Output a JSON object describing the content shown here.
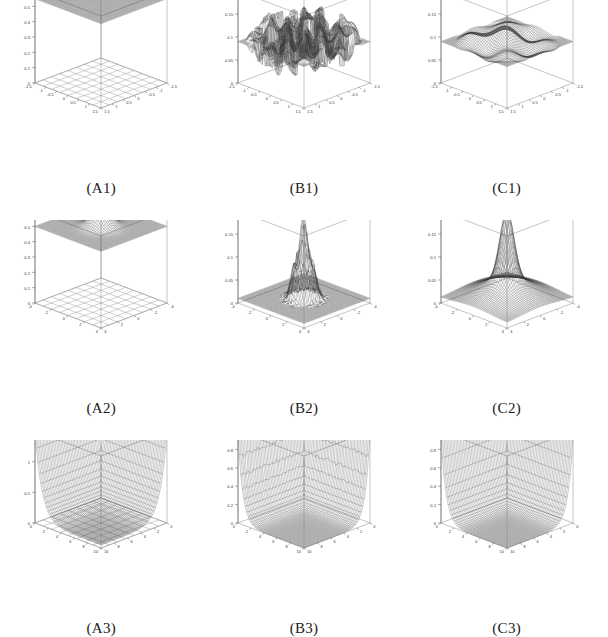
{
  "figure": {
    "layout": {
      "rows": 3,
      "cols": 3
    },
    "panels": [
      {
        "caption": "(A1)",
        "surface_kind": "plane",
        "shade": "dark",
        "floor_grid": true,
        "chart_data": {
          "type": "surface",
          "title": "(A1)",
          "xlabel": "",
          "ylabel": "",
          "zlabel": "",
          "xlim": [
            -1.5,
            1.5
          ],
          "ylim": [
            -1.5,
            1.5
          ],
          "zlim": [
            0,
            0.6
          ],
          "xticks": [
            "-1.5",
            "-1",
            "-0.5",
            "0",
            "0.5",
            "1",
            "1.5"
          ],
          "yticks": [
            "-1.5",
            "-1",
            "-0.5",
            "0",
            "0.5",
            "1",
            "1.5"
          ],
          "zticks": [
            "0",
            "0.1",
            "0.2",
            "0.3",
            "0.4",
            "0.5",
            "0.6"
          ],
          "grid": true,
          "description": "Flat constant plane at approximately z = 0.55 spanning the full domain, with a rectangular grid projected on the floor plane.",
          "surface_value": 0.55,
          "amplitude": 0.0,
          "noise": 0.0
        }
      },
      {
        "caption": "(B1)",
        "surface_kind": "rough",
        "shade": "dark",
        "floor_grid": false,
        "chart_data": {
          "type": "surface",
          "title": "(B1)",
          "xlabel": "",
          "ylabel": "",
          "zlabel": "",
          "xlim": [
            -1.5,
            1.5
          ],
          "ylim": [
            -1.5,
            1.5
          ],
          "zlim": [
            0,
            0.2
          ],
          "xticks": [
            "-1.5",
            "-1",
            "-0.5",
            "0",
            "0.5",
            "1",
            "1.5"
          ],
          "yticks": [
            "-1.5",
            "-1",
            "-0.5",
            "0",
            "0.5",
            "1",
            "1.5"
          ],
          "zticks": [
            "0",
            "0.05",
            "0.1",
            "0.15",
            "0.2"
          ],
          "grid": true,
          "description": "Rough blocky noisy surface oscillating about z = 0.09 with strong high-frequency ripples across the whole domain.",
          "surface_value": 0.09,
          "amplitude": 0.035,
          "noise": 0.03
        }
      },
      {
        "caption": "(C1)",
        "surface_kind": "wavy",
        "shade": "dark",
        "floor_grid": false,
        "chart_data": {
          "type": "surface",
          "title": "(C1)",
          "xlabel": "",
          "ylabel": "",
          "zlabel": "",
          "xlim": [
            -1.5,
            1.5
          ],
          "ylim": [
            -1.5,
            1.5
          ],
          "zlim": [
            0,
            0.2
          ],
          "xticks": [
            "-1.5",
            "-1",
            "-0.5",
            "0",
            "0.5",
            "1",
            "1.5"
          ],
          "yticks": [
            "-1.5",
            "-1",
            "-0.5",
            "0",
            "0.5",
            "1",
            "1.5"
          ],
          "zticks": [
            "0",
            "0.05",
            "0.1",
            "0.15",
            "0.2"
          ],
          "grid": true,
          "description": "Smooth undulating wavy surface centred about z = 0.09 with gentle broad ridges, a smoothed version of the rough (B1) surface.",
          "surface_value": 0.09,
          "amplitude": 0.03,
          "noise": 0.0
        }
      },
      {
        "caption": "(A2)",
        "surface_kind": "plane_bump",
        "shade": "dark",
        "floor_grid": true,
        "chart_data": {
          "type": "surface",
          "title": "(A2)",
          "xlabel": "",
          "ylabel": "",
          "zlabel": "",
          "xlim": [
            -4,
            4
          ],
          "ylim": [
            -4,
            4
          ],
          "zlim": [
            0,
            0.6
          ],
          "xticks": [
            "-4",
            "-2",
            "0",
            "2",
            "4"
          ],
          "yticks": [
            "-4",
            "-2",
            "0",
            "2",
            "4"
          ],
          "zticks": [
            "0",
            "0.1",
            "0.2",
            "0.3",
            "0.4",
            "0.5",
            "0.6"
          ],
          "grid": true,
          "description": "Flat plane at about z = 0.5 with a single smooth rounded bump rising to roughly 0.6 at the centre; contour grid projected on the floor.",
          "surface_value": 0.5,
          "amplitude": 0.12,
          "noise": 0.0
        }
      },
      {
        "caption": "(B2)",
        "surface_kind": "spike",
        "shade": "dark",
        "floor_grid": false,
        "chart_data": {
          "type": "surface",
          "title": "(B2)",
          "xlabel": "",
          "ylabel": "",
          "zlabel": "",
          "xlim": [
            -4,
            4
          ],
          "ylim": [
            -4,
            4
          ],
          "zlim": [
            0,
            0.2
          ],
          "xticks": [
            "-4",
            "-2",
            "0",
            "2",
            "4"
          ],
          "yticks": [
            "-4",
            "-2",
            "0",
            "2",
            "4"
          ],
          "zticks": [
            "0",
            "0.05",
            "0.1",
            "0.15",
            "0.2"
          ],
          "grid": true,
          "description": "Narrow jagged spike at the origin reaching about z = 0.18, surrounded by a nearly flat noisy base near zero.",
          "peak_value": 0.18,
          "base_value": 0.01,
          "noise": 0.022
        }
      },
      {
        "caption": "(C2)",
        "surface_kind": "peak",
        "shade": "dark",
        "floor_grid": false,
        "chart_data": {
          "type": "surface",
          "title": "(C2)",
          "xlabel": "",
          "ylabel": "",
          "zlabel": "",
          "xlim": [
            -4,
            4
          ],
          "ylim": [
            -4,
            4
          ],
          "zlim": [
            0,
            0.2
          ],
          "xticks": [
            "-4",
            "-2",
            "0",
            "2",
            "4"
          ],
          "yticks": [
            "-4",
            "-2",
            "0",
            "2",
            "4"
          ],
          "zticks": [
            "0",
            "0.05",
            "0.1",
            "0.15",
            "0.2"
          ],
          "grid": true,
          "description": "Smooth bell-shaped peak centred at the origin reaching about z = 0.17, decaying smoothly to a low plateau near the edges.",
          "peak_value": 0.17,
          "base_value": 0.012,
          "noise": 0.0
        }
      },
      {
        "caption": "(A3)",
        "surface_kind": "decay",
        "shade": "dark",
        "floor_grid": true,
        "chart_data": {
          "type": "surface",
          "title": "(A3)",
          "xlabel": "",
          "ylabel": "",
          "zlabel": "",
          "xlim": [
            0,
            10
          ],
          "ylim": [
            0,
            10
          ],
          "zlim": [
            0,
            1.5
          ],
          "xticks": [
            "0",
            "2",
            "4",
            "6",
            "8",
            "10"
          ],
          "yticks": [
            "0",
            "2",
            "4",
            "6",
            "8",
            "10"
          ],
          "zticks": [
            "0",
            "0.5",
            "1",
            "1.5"
          ],
          "grid": true,
          "description": "Surface rising steeply to about z = 1.5 along the near corner edge and decaying rapidly to a flat plateau near zero over most of the domain; contour grid on the floor.",
          "peak_value": 1.5,
          "base_value": 0.05,
          "decay_rate": 1.6,
          "noise": 0.0
        }
      },
      {
        "caption": "(B3)",
        "surface_kind": "decay",
        "shade": "dark",
        "floor_grid": false,
        "chart_data": {
          "type": "surface",
          "title": "(B3)",
          "xlabel": "",
          "ylabel": "",
          "zlabel": "",
          "xlim": [
            0,
            10
          ],
          "ylim": [
            0,
            10
          ],
          "zlim": [
            0,
            1
          ],
          "xticks": [
            "0",
            "2",
            "4",
            "6",
            "8",
            "10"
          ],
          "yticks": [
            "0",
            "2",
            "4",
            "6",
            "8",
            "10"
          ],
          "zticks": [
            "0",
            "0.2",
            "0.4",
            "0.6",
            "0.8",
            "1"
          ],
          "grid": true,
          "description": "Sharp narrow ridge climbing to about z = 1 at the left corner with ragged noisy decay, flat near zero elsewhere.",
          "peak_value": 1.0,
          "base_value": 0.0,
          "decay_rate": 2.4,
          "noise": 0.03
        }
      },
      {
        "caption": "(C3)",
        "surface_kind": "decay",
        "shade": "dark",
        "floor_grid": false,
        "chart_data": {
          "type": "surface",
          "title": "(C3)",
          "xlabel": "",
          "ylabel": "",
          "zlabel": "",
          "xlim": [
            0,
            10
          ],
          "ylim": [
            0,
            10
          ],
          "zlim": [
            0,
            1
          ],
          "xticks": [
            "0",
            "2",
            "4",
            "6",
            "8",
            "10"
          ],
          "yticks": [
            "0",
            "2",
            "4",
            "6",
            "8",
            "10"
          ],
          "zticks": [
            "0",
            "0.2",
            "0.4",
            "0.6",
            "0.8",
            "1"
          ],
          "grid": true,
          "description": "Smooth ridge rising to about z = 0.95 at the left corner and decaying smoothly to a flat plateau near zero across the rest of the domain.",
          "peak_value": 0.95,
          "base_value": 0.0,
          "decay_rate": 2.2,
          "noise": 0.0
        }
      }
    ],
    "colors": {
      "mesh_dark": "#3a3a3a",
      "mesh_light": "#9a9a9a",
      "axis": "#555555",
      "box": "#8c8c8c",
      "background": "#ffffff",
      "text": "#1a1a1a"
    }
  }
}
